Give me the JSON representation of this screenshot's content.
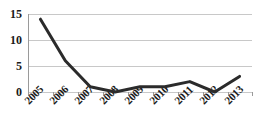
{
  "chart_data": {
    "type": "line",
    "title": "",
    "subtitle": "",
    "xlabel": "",
    "ylabel": "",
    "categories": [
      "2005",
      "2006",
      "2007",
      "2008",
      "2009",
      "2010",
      "2011",
      "2012",
      "2013"
    ],
    "values": [
      14,
      6,
      1,
      0,
      1,
      1,
      2,
      0,
      3
    ],
    "series": [
      {
        "name": "",
        "values": [
          14,
          6,
          1,
          0,
          1,
          1,
          2,
          0,
          3
        ]
      }
    ],
    "ylim": [
      0,
      15
    ],
    "yticks": [
      0,
      5,
      10,
      15
    ],
    "ytick_labels": [
      "0",
      "5",
      "10",
      "15"
    ],
    "grid": true,
    "grid_axis": "y",
    "legend": false,
    "legend_position": "none",
    "markers": false,
    "line_color": "#2b2b2b",
    "line_width": 3,
    "grid_color": "#c8c8c8",
    "axis_color": "#9a9a9a",
    "text_color": "#1a1a1a",
    "background": "#ffffff",
    "xtick_rotation": -45,
    "annotations": []
  },
  "axes": {
    "y_labels": [
      "15",
      "10",
      "5",
      "0"
    ],
    "x_labels": [
      "2005",
      "2006",
      "2007",
      "2008",
      "2009",
      "2010",
      "2011",
      "2012",
      "2013"
    ]
  }
}
